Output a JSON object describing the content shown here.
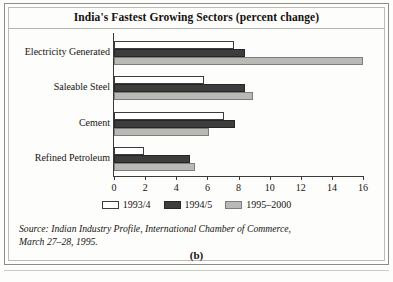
{
  "figure": {
    "title": "India's Fastest Growing Sectors (percent change)",
    "caption": "(b)",
    "source_line_1": "Source: Indian Industry Profile, International Chamber of Commerce,",
    "source_line_2": "March 27–28, 1995."
  },
  "colors": {
    "series_1993_4": "#ffffff",
    "series_1994_5": "#3d3d3d",
    "series_1995_2000": "#b9b9b5",
    "axis": "#3a3a38",
    "text": "#171412",
    "frame": "#8d8d88"
  },
  "chart_data": {
    "type": "bar",
    "orientation": "horizontal",
    "title": "India's Fastest Growing Sectors (percent change)",
    "xlabel": "",
    "ylabel": "",
    "xlim": [
      0,
      16
    ],
    "xticks": [
      0,
      2,
      4,
      6,
      8,
      10,
      12,
      14,
      16
    ],
    "xtick_labels": [
      "0",
      "2",
      "4",
      "6",
      "8",
      "10",
      "12",
      "14",
      "16"
    ],
    "grid": false,
    "legend_position": "bottom-center",
    "categories": [
      "Electricity Generated",
      "Saleable Steel",
      "Cement",
      "Refined Petroleum"
    ],
    "series": [
      {
        "name": "1993/4",
        "values": [
          7.7,
          5.8,
          7.1,
          1.9
        ]
      },
      {
        "name": "1994/5",
        "values": [
          8.4,
          8.4,
          7.8,
          4.9
        ]
      },
      {
        "name": "1995–2000",
        "values": [
          16.0,
          8.9,
          6.1,
          5.2
        ]
      }
    ]
  }
}
